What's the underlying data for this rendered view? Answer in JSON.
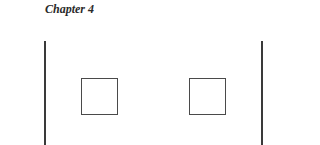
{
  "page": {
    "header": "Chapter 4"
  },
  "figure": {
    "elements": [
      {
        "type": "vertical-line",
        "position": "left"
      },
      {
        "type": "square",
        "position": "left"
      },
      {
        "type": "square",
        "position": "right"
      },
      {
        "type": "vertical-line",
        "position": "right"
      }
    ]
  }
}
